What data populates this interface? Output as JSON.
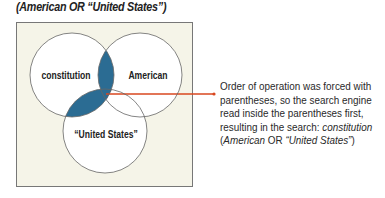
{
  "title": "(American OR “United States”)",
  "diagram": {
    "circles": [
      {
        "id": "constitution",
        "label": "constitution"
      },
      {
        "id": "american",
        "label": "American"
      },
      {
        "id": "united-states",
        "label": "“United States”"
      }
    ],
    "highlight_color": "#2b6c93",
    "arrow_color": "#d9471f",
    "background_color": "#f5f4e8"
  },
  "note": {
    "line1": "Order of operation was forced with",
    "line2": "parentheses, so the search engine",
    "line3": "read inside the parentheses first,",
    "line4_prefix": "resulting in the search: ",
    "line4_term": "constitution",
    "line5_open": "(",
    "line5_term1": "American",
    "line5_op": " OR ",
    "line5_term2": "“United States”",
    "line5_close": ")"
  }
}
